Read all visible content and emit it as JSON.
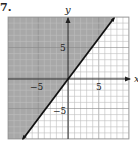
{
  "problem": {
    "number": "7."
  },
  "chart_data": {
    "type": "line",
    "title": "",
    "xlabel": "x",
    "ylabel": "y",
    "xlim": [
      -10,
      10
    ],
    "ylim": [
      -10,
      10
    ],
    "grid": true,
    "tick_labels": {
      "x": [
        "-5",
        "5"
      ],
      "y": [
        "5",
        "-5"
      ]
    },
    "series": [
      {
        "name": "boundary line",
        "equation": "y = 4/3 x",
        "style": "solid",
        "x": [
          -7.5,
          0,
          7.5
        ],
        "y": [
          -10,
          0,
          10
        ]
      }
    ],
    "shaded_region": "above-left of line (y >= 4/3 x)",
    "colors": {
      "shade": "#a8a8a8",
      "grid": "#bdbdbd",
      "line": "#111111",
      "axis": "#333333"
    }
  },
  "labels": {
    "x_axis": "x",
    "y_axis": "y",
    "x_neg5": "−5",
    "x_pos5": "5",
    "y_pos5": "5",
    "y_neg5": "−5"
  }
}
